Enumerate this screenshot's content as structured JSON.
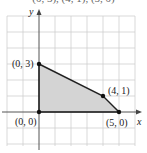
{
  "figure": {
    "clipped_top_text": "(0, 3), (4, 1), (5, 0)",
    "axes": {
      "x_label": "x",
      "y_label": "y"
    },
    "grid": {
      "origin_px": [
        39,
        112
      ],
      "unit_px": 16,
      "x_range": [
        -2,
        6
      ],
      "y_range": [
        -2,
        6
      ]
    },
    "region": {
      "vertices": [
        [
          0,
          0
        ],
        [
          0,
          3
        ],
        [
          4,
          1
        ],
        [
          5,
          0
        ]
      ],
      "fill": "#d4d4d4",
      "edge": "#222222"
    },
    "points": [
      {
        "label": "(0, 3)",
        "x": 0,
        "y": 3
      },
      {
        "label": "(4, 1)",
        "x": 4,
        "y": 1
      },
      {
        "label": "(0, 0)",
        "x": 0,
        "y": 0
      },
      {
        "label": "(5, 0)",
        "x": 5,
        "y": 0
      }
    ]
  }
}
